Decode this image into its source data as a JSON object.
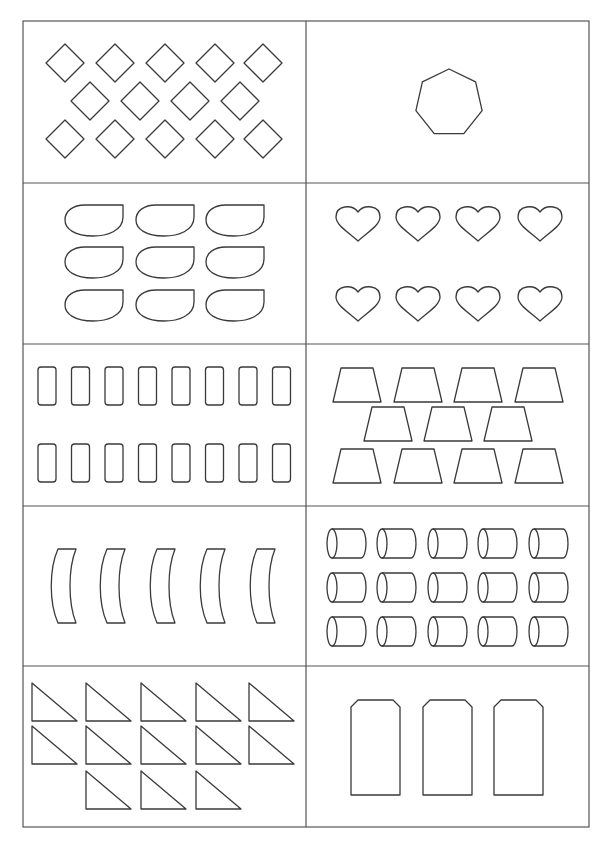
{
  "worksheet": {
    "stroke_color": "#3a3a3a",
    "background": "#ffffff",
    "grid": {
      "columns": 2,
      "rows": 5
    },
    "cells": [
      {
        "id": "diamonds",
        "shape": "diamond",
        "count": 14,
        "layout": [
          5,
          4,
          5
        ]
      },
      {
        "id": "heptagon",
        "shape": "heptagon",
        "count": 1,
        "layout": [
          1
        ]
      },
      {
        "id": "teardrops",
        "shape": "teardrop",
        "count": 9,
        "layout": [
          3,
          3,
          3
        ]
      },
      {
        "id": "hearts",
        "shape": "heart",
        "count": 8,
        "layout": [
          4,
          4
        ]
      },
      {
        "id": "rounded-rectangles",
        "shape": "rounded-rectangle",
        "count": 16,
        "layout": [
          8,
          8
        ]
      },
      {
        "id": "trapezoids",
        "shape": "trapezoid",
        "count": 11,
        "layout": [
          4,
          3,
          4
        ]
      },
      {
        "id": "curved-bars",
        "shape": "curved-bar",
        "count": 5,
        "layout": [
          5
        ]
      },
      {
        "id": "cylinders",
        "shape": "cylinder",
        "count": 15,
        "layout": [
          5,
          5,
          5
        ]
      },
      {
        "id": "right-triangles",
        "shape": "right-triangle",
        "count": 13,
        "layout": [
          5,
          5,
          3
        ]
      },
      {
        "id": "tags",
        "shape": "tag",
        "count": 3,
        "layout": [
          3
        ]
      }
    ]
  }
}
